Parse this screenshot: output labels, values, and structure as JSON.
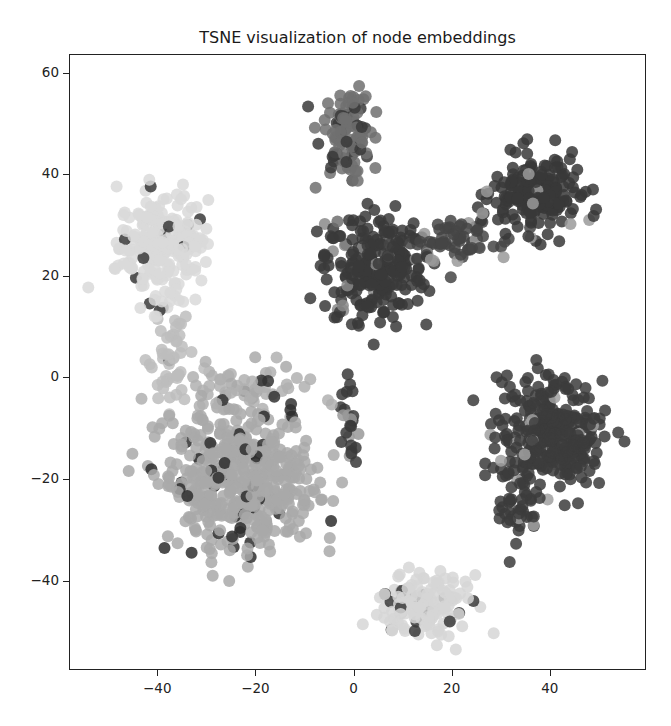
{
  "chart_data": {
    "type": "scatter",
    "title": "TSNE visualization of node embeddings",
    "xlabel": "",
    "ylabel": "",
    "xlim": [
      -58,
      59.6
    ],
    "ylim": [
      -57.6,
      63.7
    ],
    "x_ticks": [
      -40,
      -20,
      0,
      20,
      40
    ],
    "x_tick_labels": [
      "−40",
      "−20",
      "0",
      "20",
      "40"
    ],
    "y_ticks": [
      60,
      40,
      20,
      0,
      -20,
      -40
    ],
    "y_tick_labels": [
      "60",
      "40",
      "20",
      "0",
      "−20",
      "−40"
    ],
    "grid": false,
    "legend": null,
    "marker_size_px": 12,
    "clusters": [
      {
        "name": "upper-left light cluster",
        "center": [
          -39,
          26
        ],
        "spread": [
          6,
          7
        ],
        "count": 230,
        "color": "#d9d9d9",
        "outlier_color": "#3a3a3a",
        "outlier_rate": 0.04
      },
      {
        "name": "bridge strand left",
        "center": [
          -38,
          4
        ],
        "spread": [
          3,
          7
        ],
        "count": 50,
        "color": "#bdbdbd",
        "outlier_color": "#3a3a3a",
        "outlier_rate": 0.1
      },
      {
        "name": "top gray cluster",
        "center": [
          -2,
          49
        ],
        "spread": [
          3.5,
          6
        ],
        "count": 110,
        "color": "#707070",
        "outlier_color": "#3a3a3a",
        "outlier_rate": 0.25
      },
      {
        "name": "center dark cluster",
        "center": [
          4,
          22
        ],
        "spread": [
          7,
          7
        ],
        "count": 260,
        "color": "#3a3a3a",
        "outlier_color": "#8a8a8a",
        "outlier_rate": 0.08
      },
      {
        "name": "center-to-topright strand",
        "center": [
          22,
          27
        ],
        "spread": [
          7,
          3
        ],
        "count": 70,
        "color": "#454545",
        "outlier_color": "#9a9a9a",
        "outlier_rate": 0.15
      },
      {
        "name": "top-right dark cluster",
        "center": [
          37,
          36
        ],
        "spread": [
          6,
          5
        ],
        "count": 200,
        "color": "#383838",
        "outlier_color": "#9a9a9a",
        "outlier_rate": 0.05
      },
      {
        "name": "right dark cluster",
        "center": [
          40,
          -11
        ],
        "spread": [
          7,
          7
        ],
        "count": 330,
        "color": "#3c3c3c",
        "outlier_color": "#a0a0a0",
        "outlier_rate": 0.04
      },
      {
        "name": "right cluster tail",
        "center": [
          33,
          -26
        ],
        "spread": [
          3,
          5
        ],
        "count": 40,
        "color": "#3c3c3c",
        "outlier_color": "#a0a0a0",
        "outlier_rate": 0.05
      },
      {
        "name": "lower-left medium cluster",
        "center": [
          -23,
          -20
        ],
        "spread": [
          10,
          9
        ],
        "count": 520,
        "color": "#a9a9a9",
        "outlier_color": "#2e2e2e",
        "outlier_rate": 0.05
      },
      {
        "name": "lower-left cluster top fringe",
        "center": [
          -22,
          -2
        ],
        "spread": [
          10,
          3
        ],
        "count": 60,
        "color": "#b0b0b0",
        "outlier_color": "#333333",
        "outlier_rate": 0.08
      },
      {
        "name": "small dark strand near origin",
        "center": [
          -1,
          -9
        ],
        "spread": [
          1.5,
          5
        ],
        "count": 25,
        "color": "#3a3a3a",
        "outlier_color": "#999999",
        "outlier_rate": 0.2
      },
      {
        "name": "bottom light cluster",
        "center": [
          14,
          -45
        ],
        "spread": [
          6,
          4
        ],
        "count": 160,
        "color": "#d6d6d6",
        "outlier_color": "#3a3a3a",
        "outlier_rate": 0.1
      }
    ]
  }
}
